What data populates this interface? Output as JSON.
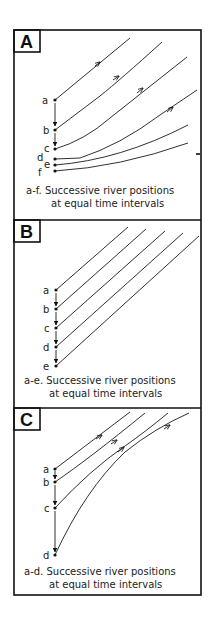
{
  "figure": {
    "panels": [
      {
        "id": "A",
        "letter": "A",
        "points": [
          {
            "label": "a",
            "x": 55,
            "y": 100
          },
          {
            "label": "b",
            "x": 55,
            "y": 130
          },
          {
            "label": "c",
            "x": 55,
            "y": 149
          },
          {
            "label": "d",
            "x": 55,
            "y": 159
          },
          {
            "label": "e",
            "x": 55,
            "y": 165
          },
          {
            "label": "f",
            "x": 55,
            "y": 171
          }
        ],
        "caption_line1": "a-f. Successive river positions",
        "caption_line2": "at equal time intervals"
      },
      {
        "id": "B",
        "letter": "B",
        "points": [
          {
            "label": "a",
            "x": 56,
            "y": 290
          },
          {
            "label": "b",
            "x": 56,
            "y": 309
          },
          {
            "label": "c",
            "x": 56,
            "y": 328
          },
          {
            "label": "d",
            "x": 56,
            "y": 347
          },
          {
            "label": "e",
            "x": 56,
            "y": 366
          }
        ],
        "caption_line1": "a-e. Successive river positions",
        "caption_line2": "at equal time intervals"
      },
      {
        "id": "C",
        "letter": "C",
        "points": [
          {
            "label": "a",
            "x": 55,
            "y": 469
          },
          {
            "label": "b",
            "x": 55,
            "y": 482
          },
          {
            "label": "c",
            "x": 55,
            "y": 508
          },
          {
            "label": "d",
            "x": 55,
            "y": 555
          }
        ],
        "caption_line1": "a-d. Successive river positions",
        "caption_line2": "at equal time intervals"
      }
    ],
    "colors": {
      "ink": "#111111",
      "background": "#ffffff"
    }
  }
}
